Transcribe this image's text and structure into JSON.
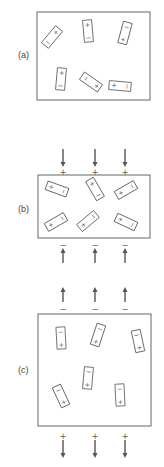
{
  "figure": {
    "colors": {
      "line": "#666666",
      "text": "#444444",
      "background": "#ffffff"
    },
    "panels": [
      {
        "id": "a",
        "label": "(a)",
        "description": "Randomly oriented dipoles, no external field",
        "box": {
          "x": 37,
          "y": 12,
          "w": 113,
          "h": 88
        },
        "label_pos": {
          "x": 18,
          "y": 58
        },
        "dipoles": [
          {
            "cx": 52,
            "cy": 37,
            "angle": 40,
            "top": "+",
            "bottom": "−"
          },
          {
            "cx": 88,
            "cy": 31,
            "angle": -5,
            "top": "+",
            "bottom": "−"
          },
          {
            "cx": 125,
            "cy": 33,
            "angle": 15,
            "top": "−",
            "bottom": "+"
          },
          {
            "cx": 61,
            "cy": 79,
            "angle": 5,
            "top": "+",
            "bottom": "−"
          },
          {
            "cx": 91,
            "cy": 82,
            "angle": -55,
            "top": "−",
            "bottom": "+"
          },
          {
            "cx": 120,
            "cy": 86,
            "angle": -85,
            "top": "+",
            "bottom": "−"
          }
        ],
        "top_arrows": [],
        "bottom_arrows": []
      },
      {
        "id": "b",
        "label": "(b)",
        "description": "Dipoles partially aligned by field (arrows pointing down into top, up into bottom)",
        "box": {
          "x": 38,
          "y": 175,
          "w": 112,
          "h": 63
        },
        "label_pos": {
          "x": 18,
          "y": 212
        },
        "dipoles": [
          {
            "cx": 57,
            "cy": 189,
            "angle": -70,
            "top": "+",
            "bottom": "−"
          },
          {
            "cx": 95,
            "cy": 189,
            "angle": -30,
            "top": "+",
            "bottom": "−"
          },
          {
            "cx": 126,
            "cy": 190,
            "angle": -120,
            "top": "+",
            "bottom": "−"
          },
          {
            "cx": 56,
            "cy": 222,
            "angle": -120,
            "top": "+",
            "bottom": "−"
          },
          {
            "cx": 88,
            "cy": 221,
            "angle": -130,
            "top": "+",
            "bottom": "−"
          },
          {
            "cx": 126,
            "cy": 222,
            "angle": -65,
            "top": "+",
            "bottom": "−"
          }
        ],
        "top_arrows": [
          {
            "x": 63,
            "y1": 149,
            "y2": 167,
            "dir": "down",
            "sign": "+",
            "sign_y": 172
          },
          {
            "x": 95,
            "y1": 149,
            "y2": 167,
            "dir": "down",
            "sign": "+",
            "sign_y": 172
          },
          {
            "x": 125,
            "y1": 149,
            "y2": 167,
            "dir": "down",
            "sign": "+",
            "sign_y": 172
          }
        ],
        "bottom_arrows": [
          {
            "x": 63,
            "y1": 263,
            "y2": 248,
            "dir": "up",
            "sign": "−",
            "sign_y": 245
          },
          {
            "x": 95,
            "y1": 263,
            "y2": 248,
            "dir": "up",
            "sign": "−",
            "sign_y": 245
          },
          {
            "x": 125,
            "y1": 263,
            "y2": 248,
            "dir": "up",
            "sign": "−",
            "sign_y": 245
          }
        ]
      },
      {
        "id": "c",
        "label": "(c)",
        "description": "Dipoles aligned vertically, arrows pointing up above and down below",
        "box": {
          "x": 38,
          "y": 314,
          "w": 113,
          "h": 112
        },
        "label_pos": {
          "x": 18,
          "y": 373
        },
        "dipoles": [
          {
            "cx": 61,
            "cy": 338,
            "angle": -3,
            "top": "−",
            "bottom": "+"
          },
          {
            "cx": 98,
            "cy": 335,
            "angle": 18,
            "top": "−",
            "bottom": "+"
          },
          {
            "cx": 138,
            "cy": 341,
            "angle": -12,
            "top": "−",
            "bottom": "+"
          },
          {
            "cx": 88,
            "cy": 378,
            "angle": 5,
            "top": "−",
            "bottom": "+"
          },
          {
            "cx": 61,
            "cy": 396,
            "angle": -25,
            "top": "−",
            "bottom": "+"
          },
          {
            "cx": 120,
            "cy": 395,
            "angle": -3,
            "top": "−",
            "bottom": "+"
          }
        ],
        "top_arrows": [
          {
            "x": 63,
            "y1": 302,
            "y2": 287,
            "dir": "up",
            "sign": "−",
            "sign_y": 309
          },
          {
            "x": 95,
            "y1": 302,
            "y2": 287,
            "dir": "up",
            "sign": "−",
            "sign_y": 309
          },
          {
            "x": 125,
            "y1": 302,
            "y2": 287,
            "dir": "up",
            "sign": "−",
            "sign_y": 309
          }
        ],
        "bottom_arrows": [
          {
            "x": 63,
            "y1": 440,
            "y2": 458,
            "dir": "down",
            "sign": "+",
            "sign_y": 436
          },
          {
            "x": 95,
            "y1": 440,
            "y2": 458,
            "dir": "down",
            "sign": "+",
            "sign_y": 436
          },
          {
            "x": 125,
            "y1": 440,
            "y2": 458,
            "dir": "down",
            "sign": "+",
            "sign_y": 436
          }
        ]
      }
    ]
  }
}
